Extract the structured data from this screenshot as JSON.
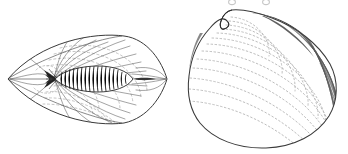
{
  "plate": {
    "background_color": "#ffffff",
    "ink_color": "#2b2b2b",
    "faint_ink_color": "#b9b9b9",
    "mid_ink_color": "#8d8d8d",
    "width": 348,
    "height": 154,
    "description": "Two monochrome scientific line-drawings side by side on a white page: a lens/leaf-shaped specimen with a segmented spindle-shaped body at left, and a bivalve clam shell in lateral view at right."
  },
  "figures": [
    {
      "id": "left-specimen",
      "name": "lens-shaped-specimen",
      "label": "",
      "shape": "biconvex lens / leaf outline with pointed left and right tips",
      "outline_color": "#3a3a3a",
      "bounds": {
        "x": 8,
        "y": 36,
        "width": 160,
        "height": 92
      },
      "tips": {
        "left": [
          8,
          79
        ],
        "right": [
          167,
          79
        ]
      },
      "axis": {
        "from": [
          8,
          79
        ],
        "to": [
          167,
          79
        ]
      },
      "body": {
        "name": "segmented-spindle-body",
        "shape": "elongate fusiform body with transverse annulations",
        "bounds": {
          "x": 47,
          "y": 66,
          "width": 85,
          "height": 22
        },
        "segment_count": 16,
        "fill": "#ffffff",
        "stroke": "#1f1f1f"
      },
      "radiating_lines": {
        "count": 26,
        "color": "#4a4a4a",
        "origin": [
          55,
          79
        ]
      },
      "dotted_arcs": {
        "count": 9,
        "color": "#b5b5b5",
        "style": "dashed"
      }
    },
    {
      "id": "right-specimen",
      "name": "bivalve-shell",
      "label": "",
      "shape": "rounded triangular-ovate bivalve valve, umbo at upper left of centre",
      "outline_color": "#3a3a3a",
      "bounds": {
        "x": 187,
        "y": 8,
        "width": 151,
        "height": 140
      },
      "umbo": {
        "name": "umbo-beak",
        "x": 232,
        "y": 10
      },
      "growth_lines": {
        "count": 13,
        "color": "#b5b5b5",
        "style": "dotted-concentric"
      },
      "radial_shading": {
        "count": 16,
        "color": "#6d6d6d",
        "region": "posterior-dorsal margin"
      }
    }
  ],
  "artifacts": {
    "top_crop": {
      "name": "cropped-glyph-row",
      "description": "two small partial ring glyphs clipped by the top edge of the crop",
      "items": [
        {
          "x": 232,
          "y": 2,
          "r": 3
        },
        {
          "x": 266,
          "y": 2,
          "r": 3
        }
      ],
      "color": "#9a9a9a"
    }
  }
}
